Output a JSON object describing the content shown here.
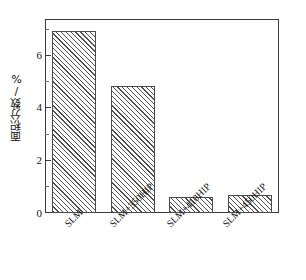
{
  "chart_data": {
    "type": "bar",
    "title": "",
    "subtitle": "",
    "xlabel": "",
    "ylabel": "面积分数/%",
    "categories": [
      "SLM",
      "SLM+350HIP",
      "SLM+410HIP",
      "SLM+450HIP"
    ],
    "values": [
      6.9,
      4.8,
      0.6,
      0.7
    ],
    "series": [
      {
        "name": "面积分数",
        "values": [
          6.9,
          4.8,
          0.6,
          0.7
        ]
      }
    ],
    "ylim": [
      0,
      7.35
    ],
    "xlim": [
      0,
      4
    ],
    "ytick_labels": [
      "0",
      "2",
      "4",
      "6"
    ],
    "ytick_values": [
      0,
      2,
      4,
      6
    ],
    "yminor_tick_values": [
      1,
      3,
      5,
      7
    ],
    "grid": false,
    "legend": null,
    "bar_fill": "hatched-diagonal",
    "bar_edge_color": "#4a4a4a",
    "bar_hatch_color": "#4f4f4f",
    "axis_color": "#3a3a3a",
    "background_color": "#ffffff",
    "xtick_label_rotation": -45
  },
  "axis": {
    "y_title": "面积分数/%",
    "ticks": [
      {
        "label": "6",
        "value": 6
      },
      {
        "label": "4",
        "value": 4
      },
      {
        "label": "2",
        "value": 2
      },
      {
        "label": "0",
        "value": 0
      }
    ]
  },
  "categories": {
    "c0": "SLM",
    "c1": "SLM+350HIP",
    "c2": "SLM+410HIP",
    "c3": "SLM+450HIP"
  }
}
